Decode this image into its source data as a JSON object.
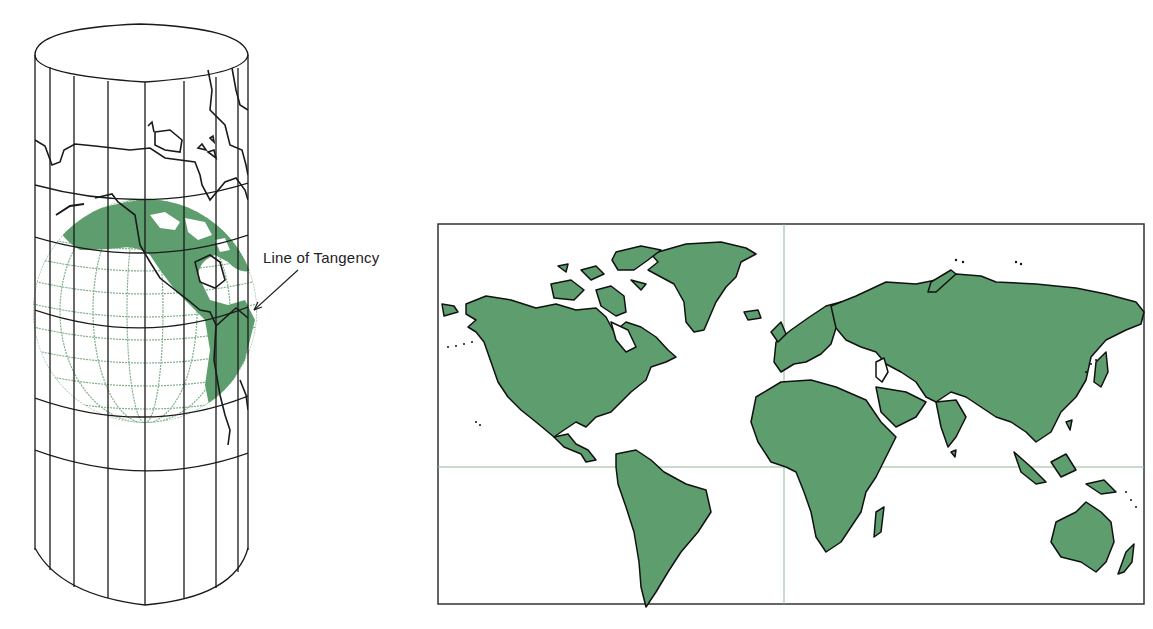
{
  "figure": {
    "cylinder_diagram": {
      "annotation": "Line of Tangency",
      "description": "Globe inside tangent cylinder (Mercator projection construction)"
    },
    "world_map": {
      "description": "Mercator projection world map",
      "grid_lines": [
        "equator",
        "prime meridian"
      ]
    }
  },
  "colors": {
    "land": "#5e9e6e",
    "land_outline": "#111111",
    "graticule_globe": "#7fb08a",
    "grid_line": "#8fb89a",
    "cylinder_lines": "#1a1a1a",
    "background": "#ffffff"
  }
}
